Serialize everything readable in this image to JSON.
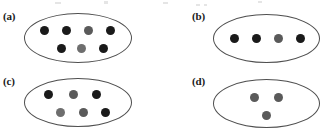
{
  "figure": {
    "background_color": "#ffffff",
    "width": 325,
    "height": 136,
    "outline_color": "#4f4f4f",
    "black_dot_color": "#1a1a1a",
    "gray_dot_color": "#5a5a5a",
    "light_gray_dot_color": "#6e6e6e"
  },
  "panels": [
    {
      "label": "(a)",
      "label_x": 3,
      "label_y": 11,
      "ellipse": {
        "x": 24,
        "y": 13,
        "w": 108,
        "h": 50
      },
      "dot_count": 7,
      "black_count": 5,
      "gray_count": 2,
      "dots": [
        {
          "x": 40,
          "y": 26,
          "d": 9,
          "shade": "black"
        },
        {
          "x": 62,
          "y": 26,
          "d": 9,
          "shade": "black"
        },
        {
          "x": 84,
          "y": 26,
          "d": 9,
          "shade": "gray"
        },
        {
          "x": 106,
          "y": 26,
          "d": 9,
          "shade": "black"
        },
        {
          "x": 57,
          "y": 44,
          "d": 9,
          "shade": "black"
        },
        {
          "x": 77,
          "y": 44,
          "d": 9,
          "shade": "light-gray"
        },
        {
          "x": 99,
          "y": 44,
          "d": 9,
          "shade": "black"
        }
      ]
    },
    {
      "label": "(b)",
      "label_x": 192,
      "label_y": 11,
      "ellipse": {
        "x": 213,
        "y": 14,
        "w": 107,
        "h": 49
      },
      "dot_count": 4,
      "black_count": 3,
      "gray_count": 1,
      "dots": [
        {
          "x": 230,
          "y": 34,
          "d": 9,
          "shade": "black"
        },
        {
          "x": 252,
          "y": 34,
          "d": 9,
          "shade": "black"
        },
        {
          "x": 274,
          "y": 34,
          "d": 9,
          "shade": "gray"
        },
        {
          "x": 296,
          "y": 34,
          "d": 9,
          "shade": "black"
        }
      ]
    },
    {
      "label": "(c)",
      "label_x": 3,
      "label_y": 76,
      "ellipse": {
        "x": 24,
        "y": 78,
        "w": 108,
        "h": 49
      },
      "dot_count": 6,
      "black_count": 3,
      "gray_count": 3,
      "dots": [
        {
          "x": 44,
          "y": 90,
          "d": 9,
          "shade": "black"
        },
        {
          "x": 69,
          "y": 90,
          "d": 9,
          "shade": "gray"
        },
        {
          "x": 92,
          "y": 90,
          "d": 9,
          "shade": "black"
        },
        {
          "x": 56,
          "y": 108,
          "d": 9,
          "shade": "light-gray"
        },
        {
          "x": 79,
          "y": 108,
          "d": 9,
          "shade": "gray"
        },
        {
          "x": 101,
          "y": 108,
          "d": 9,
          "shade": "black"
        }
      ]
    },
    {
      "label": "(d)",
      "label_x": 192,
      "label_y": 76,
      "ellipse": {
        "x": 213,
        "y": 79,
        "w": 107,
        "h": 49
      },
      "dot_count": 3,
      "black_count": 0,
      "gray_count": 3,
      "dots": [
        {
          "x": 250,
          "y": 93,
          "d": 9,
          "shade": "gray"
        },
        {
          "x": 274,
          "y": 93,
          "d": 9,
          "shade": "gray"
        },
        {
          "x": 262,
          "y": 111,
          "d": 9,
          "shade": "gray"
        }
      ]
    }
  ]
}
